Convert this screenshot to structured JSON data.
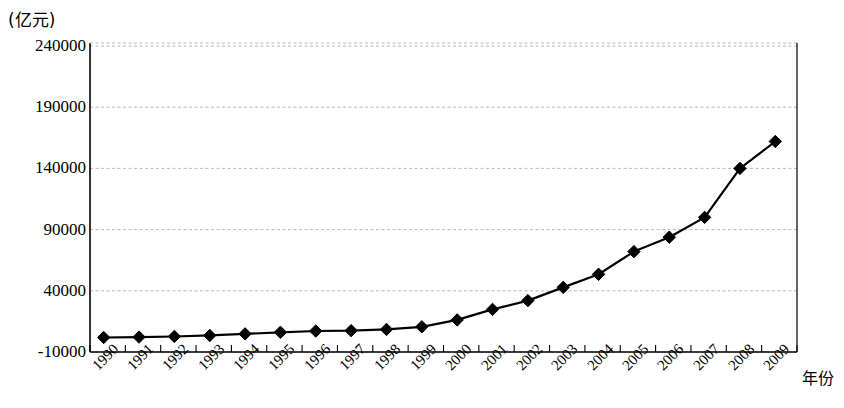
{
  "chart_data": {
    "type": "line",
    "title": "",
    "subtitle": "",
    "xlabel": "年份",
    "ylabel": "(亿元)",
    "unit_label": "(亿元)",
    "grid": true,
    "legend": null,
    "marker": "diamond",
    "line_color": "#000000",
    "marker_color": "#000000",
    "grid_color": "#b9b9b9",
    "axis_color": "#000000",
    "xlim": [
      1990,
      2009
    ],
    "ylim": [
      -10000,
      240000
    ],
    "yticks": [
      -10000,
      40000,
      90000,
      140000,
      190000,
      240000
    ],
    "ytick_labels": [
      "-10000",
      "40000",
      "90000",
      "140000",
      "190000",
      "240000"
    ],
    "categories": [
      "1990",
      "1991",
      "1992",
      "1993",
      "1994",
      "1995",
      "1996",
      "1997",
      "1998",
      "1999",
      "2000",
      "2001",
      "2002",
      "2003",
      "2004",
      "2005",
      "2006",
      "2007",
      "2008",
      "2009"
    ],
    "x": [
      1990,
      1991,
      1992,
      1993,
      1994,
      1995,
      1996,
      1997,
      1998,
      1999,
      2000,
      2001,
      2002,
      2003,
      2004,
      2005,
      2006,
      2007,
      2008,
      2009
    ],
    "values": [
      1850,
      2180,
      2690,
      3530,
      4820,
      6080,
      7120,
      7450,
      8440,
      10600,
      16200,
      24800,
      32000,
      42800,
      53500,
      72000,
      83800,
      100000,
      140000,
      162000
    ],
    "series": [
      {
        "name": "",
        "values": [
          1850,
          2180,
          2690,
          3530,
          4820,
          6080,
          7120,
          7450,
          8440,
          10600,
          16200,
          24800,
          32000,
          42800,
          53500,
          72000,
          83800,
          100000,
          140000,
          162000
        ]
      }
    ]
  }
}
